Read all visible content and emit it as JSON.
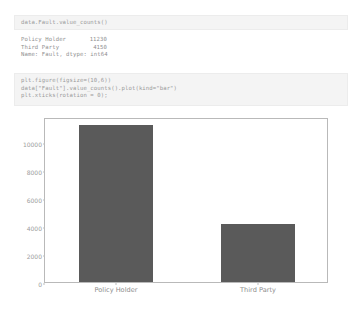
{
  "cells": [
    {
      "kind": "code-input",
      "lines": [
        "data.Fault.value_counts()"
      ]
    },
    {
      "kind": "code-input",
      "lines": [
        "plt.figure(figsize=(10,6))",
        "data[\"Fault\"].value_counts().plot(kind=\"bar\")",
        "plt.xticks(rotation = 0);"
      ]
    }
  ],
  "text_output": {
    "rows": [
      {
        "label": "Policy Holder",
        "value": "11230"
      },
      {
        "label": "Third Party",
        "value": "4150"
      }
    ],
    "footer": "Name: Fault, dtype: int64"
  },
  "chart_data": {
    "type": "bar",
    "title": "",
    "xlabel": "",
    "ylabel": "",
    "categories": [
      "Policy Holder",
      "Third Party"
    ],
    "values": [
      11230,
      4150
    ],
    "yticks": [
      0,
      2000,
      4000,
      6000,
      8000,
      10000
    ],
    "ytick_labels": [
      "0",
      "2000",
      "4000",
      "6000",
      "8000",
      "10000"
    ],
    "ylim": [
      0,
      11800
    ],
    "grid": false,
    "legend": false,
    "bar_color": "#5a5a5a",
    "frame_color": "#b9b9b9",
    "tick_color": "#9d9d9d"
  },
  "theme": {
    "page_bg": "#ffffff",
    "cell_bg": "#f4f4f4",
    "cell_border": "#ececec",
    "code_text": "#9a9a9a",
    "output_text": "#8f8f8f"
  }
}
